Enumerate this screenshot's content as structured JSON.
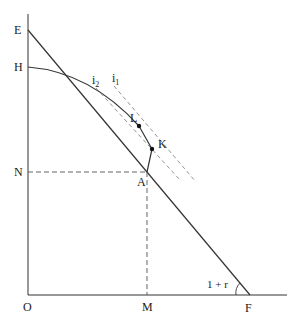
{
  "diagram": {
    "axes": {
      "origin_label": "O",
      "x_axis_end_label": "F",
      "y_axis_top_label": "E"
    },
    "points": {
      "E": {
        "label": "E"
      },
      "H": {
        "label": "H"
      },
      "N": {
        "label": "N"
      },
      "A": {
        "label": "A"
      },
      "L": {
        "label": "L"
      },
      "K": {
        "label": "K"
      },
      "M": {
        "label": "M"
      },
      "O": {
        "label": "O"
      },
      "F": {
        "label": "F"
      }
    },
    "indifference_curves": [
      {
        "label": "i",
        "subscript": "2"
      },
      {
        "label": "i",
        "subscript": "1"
      }
    ],
    "angle_label": "1 + r"
  }
}
